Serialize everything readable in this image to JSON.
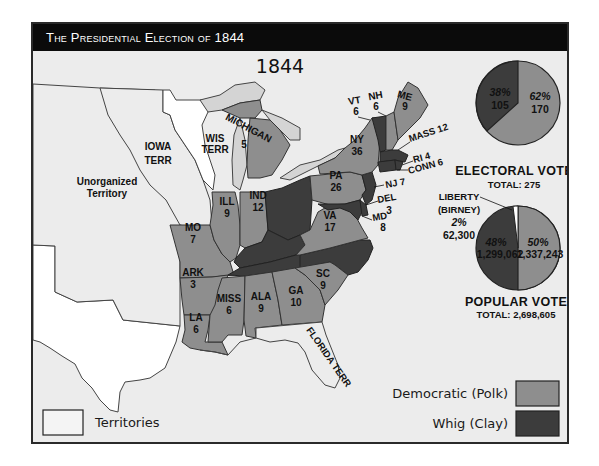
{
  "header": {
    "title": "The Presidential Election of 1844"
  },
  "map": {
    "year_label": "1844",
    "colors": {
      "background": "#ececec",
      "democratic": "#8e8e8e",
      "whig": "#3c3c3c",
      "territory": "#ffffff",
      "lakes": "#d4d4d4",
      "border": "#2a2a2a"
    },
    "regions": [
      {
        "name": "Unorganized Territory",
        "label": "Unorganized\nTerritory",
        "type": "territory"
      },
      {
        "name": "Iowa Territory",
        "label": "IOWA\nTERR",
        "type": "territory"
      },
      {
        "name": "Wisconsin Territory",
        "label": "WIS\nTERR",
        "type": "territory"
      },
      {
        "name": "Florida Territory",
        "label": "FLORIDA TERR",
        "type": "territory"
      }
    ],
    "states": [
      {
        "abbr": "ME",
        "votes": 9,
        "party": "democratic"
      },
      {
        "abbr": "NH",
        "votes": 6,
        "party": "democratic"
      },
      {
        "abbr": "VT",
        "votes": 6,
        "party": "whig"
      },
      {
        "abbr": "MASS",
        "votes": 12,
        "party": "whig"
      },
      {
        "abbr": "RI",
        "votes": 4,
        "party": "whig"
      },
      {
        "abbr": "CONN",
        "votes": 6,
        "party": "whig"
      },
      {
        "abbr": "NY",
        "votes": 36,
        "party": "democratic"
      },
      {
        "abbr": "NJ",
        "votes": 7,
        "party": "whig"
      },
      {
        "abbr": "PA",
        "votes": 26,
        "party": "democratic"
      },
      {
        "abbr": "DEL",
        "votes": 3,
        "party": "whig"
      },
      {
        "abbr": "MD",
        "votes": 8,
        "party": "whig"
      },
      {
        "abbr": "VA",
        "votes": 17,
        "party": "democratic"
      },
      {
        "abbr": "MICHIGAN",
        "votes": 5,
        "party": "democratic"
      },
      {
        "abbr": "IND",
        "votes": 12,
        "party": "democratic"
      },
      {
        "abbr": "ILL",
        "votes": 9,
        "party": "democratic"
      },
      {
        "abbr": "MO",
        "votes": 7,
        "party": "democratic"
      },
      {
        "abbr": "ARK",
        "votes": 3,
        "party": "democratic"
      },
      {
        "abbr": "LA",
        "votes": 6,
        "party": "democratic"
      },
      {
        "abbr": "MISS",
        "votes": 6,
        "party": "democratic"
      },
      {
        "abbr": "ALA",
        "votes": 9,
        "party": "democratic"
      },
      {
        "abbr": "GA",
        "votes": 10,
        "party": "democratic"
      },
      {
        "abbr": "SC",
        "votes": 9,
        "party": "democratic"
      },
      {
        "abbr": "OHIO",
        "votes": null,
        "party": "whig"
      },
      {
        "abbr": "KY",
        "votes": null,
        "party": "whig"
      },
      {
        "abbr": "TENN",
        "votes": null,
        "party": "whig"
      },
      {
        "abbr": "NC",
        "votes": null,
        "party": "whig"
      }
    ],
    "labels": {
      "unorg_1": "Unorganized",
      "unorg_2": "Territory",
      "iowa_1": "IOWA",
      "iowa_2": "TERR",
      "wis_1": "WIS",
      "wis_2": "TERR",
      "florida": "FLORIDA TERR",
      "me": "ME",
      "me_v": "9",
      "nh": "NH",
      "nh_v": "6",
      "vt": "VT",
      "vt_v": "6",
      "mass": "MASS 12",
      "ri": "RI 4",
      "conn": "CONN 6",
      "ny": "NY",
      "ny_v": "36",
      "nj": "NJ 7",
      "pa": "PA",
      "pa_v": "26",
      "del": "DEL",
      "del_v": "3",
      "md": "MD",
      "md_v": "8",
      "va": "VA",
      "va_v": "17",
      "mich": "MICHIGAN",
      "mich_v": "5",
      "ind": "IND",
      "ind_v": "12",
      "ill": "ILL",
      "ill_v": "9",
      "mo": "MO",
      "mo_v": "7",
      "ark": "ARK",
      "ark_v": "3",
      "la": "LA",
      "la_v": "6",
      "miss": "MISS",
      "miss_v": "6",
      "ala": "ALA",
      "ala_v": "9",
      "ga": "GA",
      "ga_v": "10",
      "sc": "SC",
      "sc_v": "9"
    }
  },
  "electoral_vote": {
    "title": "ELECTORAL VOTE",
    "total_label": "TOTAL: 275",
    "total": 275,
    "slices": [
      {
        "party": "Democratic (Polk)",
        "percent_label": "62%",
        "value_label": "170",
        "value": 170
      },
      {
        "party": "Whig (Clay)",
        "percent_label": "38%",
        "value_label": "105",
        "value": 105
      }
    ]
  },
  "popular_vote": {
    "title": "POPULAR VOTE",
    "total_label": "TOTAL: 2,698,605",
    "total": 2698605,
    "slices": [
      {
        "party": "Democratic (Polk)",
        "percent_label": "50%",
        "value_label": "1,337,243",
        "value": 1337243
      },
      {
        "party": "Whig (Clay)",
        "percent_label": "48%",
        "value_label": "1,299,062",
        "value": 1299062
      },
      {
        "party": "Liberty (Birney)",
        "percent_label": "2%",
        "value_label": "62,300",
        "value": 62300
      }
    ],
    "liberty_label_1": "LIBERTY",
    "liberty_label_2": "(BIRNEY)"
  },
  "legend": {
    "items": [
      {
        "label": "Territories",
        "color": "#ffffff"
      },
      {
        "label": "Democratic (Polk)",
        "color": "#8e8e8e"
      },
      {
        "label": "Whig (Clay)",
        "color": "#3c3c3c"
      }
    ]
  }
}
